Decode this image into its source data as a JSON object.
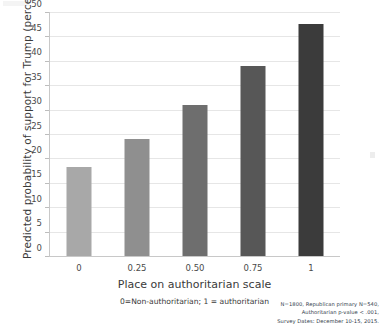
{
  "chart_data": {
    "type": "bar",
    "title": "",
    "categories": [
      "0",
      "0.25",
      "0.50",
      "0.75",
      "1"
    ],
    "values": [
      18.3,
      24.0,
      31.0,
      39.0,
      47.5
    ],
    "series": [
      {
        "name": "Predicted probability of support for Trump",
        "values": [
          18.3,
          24.0,
          31.0,
          39.0,
          47.5
        ]
      }
    ],
    "xlabel": "Place on authoritarian scale",
    "xsublabel": "0=Non-authoritarian; 1 = authoritarian",
    "ylabel": "Predicted probability of support for Trump (percent)",
    "ylim": [
      0,
      50
    ],
    "yticks": [
      0,
      5,
      10,
      15,
      20,
      25,
      30,
      35,
      40,
      45,
      50
    ],
    "ytick_labels": [
      "0",
      "5",
      "10",
      "15",
      "20",
      "25",
      "30",
      "35",
      "40",
      "45",
      "50"
    ],
    "grid": true,
    "legend": "none",
    "bar_colors": [
      "#a8a8a8",
      "#8f8f8f",
      "#6e6e6e",
      "#575757",
      "#3b3b3b"
    ]
  },
  "footnote": {
    "line1": "N=1800, Republican primary N=540,",
    "line2": "Authoritarian p-value < .001,",
    "line3": "Survey Dates: December 10-15, 2015."
  }
}
